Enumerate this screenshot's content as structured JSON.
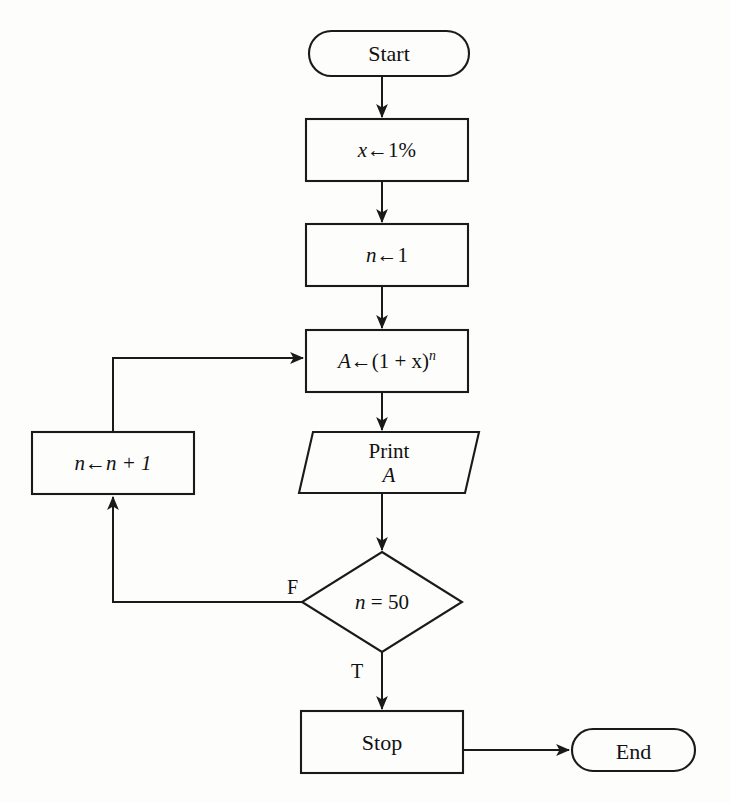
{
  "diagram": {
    "type": "flowchart",
    "background_color": "#fdfdfc",
    "line_color": "#1a1a1a",
    "nodes": [
      {
        "id": "start",
        "shape": "terminal",
        "label": "Start"
      },
      {
        "id": "set-x",
        "shape": "process",
        "label_var": "x",
        "label_op": "←",
        "label_value": "1",
        "label_unit": "%"
      },
      {
        "id": "set-n",
        "shape": "process",
        "label_var": "n",
        "label_op": "←",
        "label_value": "1"
      },
      {
        "id": "compute-a",
        "shape": "process",
        "label_var": "A",
        "label_op": "←",
        "label_expr": "(1 + x)",
        "label_exponent": "n"
      },
      {
        "id": "print-a",
        "shape": "io-parallelogram",
        "label_line1": "Print",
        "label_line2": "A"
      },
      {
        "id": "decision-n",
        "shape": "diamond",
        "label_var": "n",
        "label_op": "=",
        "label_value": "50"
      },
      {
        "id": "increment-n",
        "shape": "process",
        "label_var": "n",
        "label_op": "←",
        "label_expr": "n + 1"
      },
      {
        "id": "stop",
        "shape": "process",
        "label": "Stop"
      },
      {
        "id": "end",
        "shape": "terminal",
        "label": "End"
      }
    ],
    "branch_labels": {
      "false": "F",
      "true": "T"
    }
  }
}
